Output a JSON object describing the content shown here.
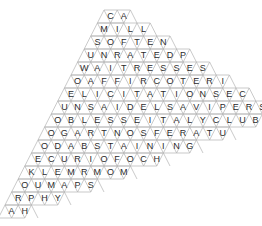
{
  "puzzle": {
    "type": "triangular-lattice-word-search",
    "shape": "rhomboid",
    "rows_count": 16,
    "columns_max": 16,
    "cell_width": 13.2,
    "cell_height": 13,
    "row_shift": -6.6,
    "origin_x": 104,
    "origin_y": 10,
    "grid_line_color": "#b3b3b3",
    "letter_color": "#2b2b2b",
    "background_color": "#ffffff",
    "rows": [
      {
        "index": 1,
        "letters": [
          "C",
          "A"
        ]
      },
      {
        "index": 2,
        "letters": [
          "M",
          "I",
          "L",
          "L"
        ]
      },
      {
        "index": 3,
        "letters": [
          "S",
          "O",
          "F",
          "T",
          "E",
          "N"
        ]
      },
      {
        "index": 4,
        "letters": [
          "U",
          "N",
          "R",
          "A",
          "T",
          "E",
          "D",
          "P"
        ]
      },
      {
        "index": 5,
        "letters": [
          "W",
          "A",
          "I",
          "T",
          "R",
          "E",
          "S",
          "S",
          "E",
          "S"
        ]
      },
      {
        "index": 6,
        "letters": [
          "O",
          "A",
          "F",
          "F",
          "I",
          "R",
          "C",
          "O",
          "T",
          "E",
          "R",
          "I"
        ]
      },
      {
        "index": 7,
        "letters": [
          "E",
          "L",
          "I",
          "C",
          "I",
          "T",
          "A",
          "T",
          "I",
          "O",
          "N",
          "S",
          "E",
          "C"
        ]
      },
      {
        "index": 8,
        "letters": [
          "U",
          "N",
          "S",
          "A",
          "I",
          "D",
          "E",
          "L",
          "S",
          "A",
          "V",
          "I",
          "P",
          "E",
          "R",
          "S"
        ]
      },
      {
        "index": 9,
        "letters": [
          "O",
          "B",
          "L",
          "E",
          "S",
          "S",
          "E",
          "I",
          "T",
          "A",
          "L",
          "Y",
          "C",
          "L",
          "U",
          "B"
        ]
      },
      {
        "index": 10,
        "letters": [
          "O",
          "G",
          "A",
          "R",
          "T",
          "N",
          "O",
          "S",
          "F",
          "E",
          "R",
          "A",
          "T",
          "U"
        ]
      },
      {
        "index": 11,
        "letters": [
          "O",
          "D",
          "A",
          "B",
          "S",
          "T",
          "A",
          "I",
          "N",
          "I",
          "N",
          "G"
        ]
      },
      {
        "index": 12,
        "letters": [
          "E",
          "C",
          "U",
          "R",
          "I",
          "O",
          "F",
          "O",
          "C",
          "H"
        ]
      },
      {
        "index": 13,
        "letters": [
          "K",
          "L",
          "E",
          "M",
          "R",
          "M",
          "O",
          "M"
        ]
      },
      {
        "index": 14,
        "letters": [
          "O",
          "U",
          "M",
          "A",
          "P",
          "S"
        ]
      },
      {
        "index": 15,
        "letters": [
          "R",
          "P",
          "H",
          "Y"
        ]
      },
      {
        "index": 16,
        "letters": [
          "A",
          "H"
        ]
      }
    ]
  }
}
